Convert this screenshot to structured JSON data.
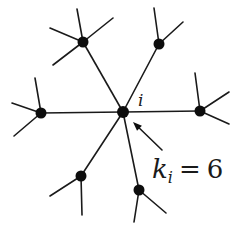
{
  "diagram": {
    "center_node": {
      "id": "i",
      "label": "i",
      "x": 123,
      "y": 112
    },
    "degree_label": {
      "k": "k",
      "sub": "i",
      "eq": "=",
      "value": "6"
    },
    "neighbors": [
      {
        "x": 83,
        "y": 42,
        "stubs": [
          [
            77,
            9
          ],
          [
            113,
            18
          ],
          [
            50,
            28
          ],
          [
            53,
            65
          ]
        ]
      },
      {
        "x": 159,
        "y": 44,
        "stubs": [
          [
            154,
            8
          ],
          [
            183,
            22
          ]
        ]
      },
      {
        "x": 41,
        "y": 113,
        "stubs": [
          [
            35,
            78
          ],
          [
            12,
            103
          ],
          [
            14,
            136
          ]
        ]
      },
      {
        "x": 200,
        "y": 111,
        "stubs": [
          [
            195,
            73
          ],
          [
            229,
            92
          ],
          [
            229,
            124
          ]
        ]
      },
      {
        "x": 81,
        "y": 176,
        "stubs": [
          [
            50,
            196
          ],
          [
            82,
            215
          ]
        ]
      },
      {
        "x": 139,
        "y": 190,
        "stubs": [
          [
            134,
            222
          ],
          [
            166,
            213
          ]
        ]
      }
    ],
    "arrow": {
      "from": [
        162,
        150
      ],
      "to": [
        133,
        122
      ]
    },
    "colors": {
      "ink": "#1a1a1a",
      "node": "#0d0d0d",
      "background": "#ffffff"
    }
  }
}
